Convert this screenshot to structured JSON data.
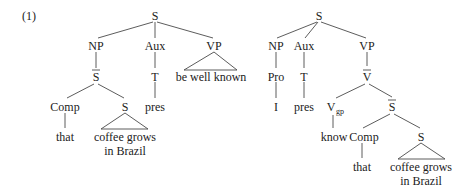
{
  "example_number": "(1)",
  "tree_left": {
    "root": "S",
    "np": "NP",
    "aux": "Aux",
    "vp": "VP",
    "sbar": "S",
    "t": "T",
    "vp_text": "be well known",
    "comp": "Comp",
    "s_embedded": "S",
    "pres": "pres",
    "that": "that",
    "clause_line1": "coffee grows",
    "clause_line2": "in Brazil"
  },
  "tree_right": {
    "root": "S",
    "np": "NP",
    "aux": "Aux",
    "vp": "VP",
    "pro": "Pro",
    "t": "T",
    "vbar": "V",
    "pronoun": "I",
    "pres": "pres",
    "v": "V",
    "v_subscript": "gp",
    "sbar": "S",
    "know": "know",
    "comp": "Comp",
    "s_embedded": "S",
    "that": "that",
    "clause_line1": "coffee grows",
    "clause_line2": "in Brazil"
  }
}
